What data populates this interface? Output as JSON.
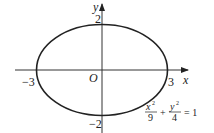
{
  "figure": {
    "axis_labels": {
      "x": "x",
      "y": "y"
    },
    "origin_label": "O",
    "ticks": {
      "x_neg": "−3",
      "x_pos": "3",
      "y_pos": "2",
      "y_neg": "−2"
    },
    "equation": {
      "num1": "x",
      "den1": "9",
      "num2": "y",
      "den2": "4",
      "exp": "2",
      "plus": "+",
      "rhs": "= 1"
    },
    "ellipse": {
      "a": 3,
      "b": 2
    },
    "stroke_color": "#222222"
  }
}
